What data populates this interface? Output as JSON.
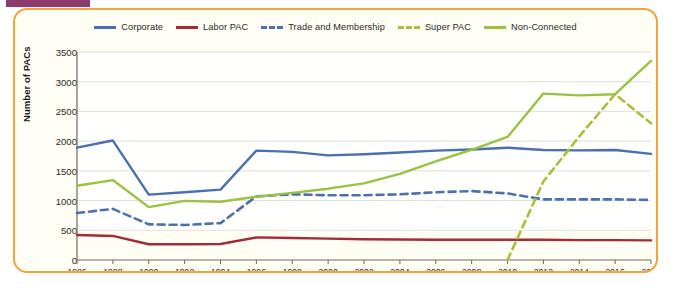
{
  "figure": {
    "frame_color": "#f0a53c",
    "background": "#fffef5",
    "tab_color": "#8d3a6e"
  },
  "chart_data": {
    "type": "line",
    "title": "",
    "xlabel": "",
    "ylabel": "Number of PACs",
    "ylim": [
      0,
      3500
    ],
    "ytick_step": 500,
    "yticks": [
      "0",
      "500",
      "1000",
      "1500",
      "2000",
      "2500",
      "3000",
      "3500"
    ],
    "grid": true,
    "legend_position": "top-center",
    "categories": [
      1986,
      1988,
      1990,
      1992,
      1994,
      1996,
      1998,
      2000,
      2002,
      2004,
      2006,
      2008,
      2010,
      2012,
      2014,
      2016,
      2018
    ],
    "xtick_labels": [
      "1986",
      "1988",
      "1990",
      "1992",
      "1994",
      "1996",
      "1998",
      "2000",
      "2002",
      "2004",
      "2006",
      "2008",
      "2010",
      "2012",
      "2014",
      "2016",
      "2018"
    ],
    "series": [
      {
        "name": "Corporate",
        "color": "#4a70b0",
        "style": "solid",
        "values": [
          1890,
          2010,
          1100,
          1140,
          1185,
          1840,
          1820,
          1760,
          1780,
          1810,
          1840,
          1860,
          1890,
          1850,
          1845,
          1850,
          1785
        ]
      },
      {
        "name": "Labor PAC",
        "color": "#a42a36",
        "style": "solid",
        "values": [
          420,
          405,
          265,
          265,
          270,
          380,
          370,
          360,
          350,
          345,
          340,
          340,
          340,
          340,
          335,
          335,
          330
        ]
      },
      {
        "name": "Trade and Membership",
        "color": "#4a70b0",
        "style": "dashed",
        "values": [
          790,
          860,
          600,
          590,
          620,
          1070,
          1105,
          1090,
          1090,
          1105,
          1140,
          1160,
          1120,
          1020,
          1020,
          1020,
          1010
        ]
      },
      {
        "name": "Super PAC",
        "color": "#a8bf3e",
        "style": "dashed",
        "values": [
          null,
          null,
          null,
          null,
          null,
          null,
          null,
          null,
          null,
          null,
          null,
          null,
          0,
          1320,
          2080,
          2790,
          2300
        ]
      },
      {
        "name": "Non-Connected",
        "color": "#9ac23e",
        "style": "solid",
        "values": [
          1250,
          1345,
          890,
          995,
          980,
          1065,
          1130,
          1200,
          1290,
          1450,
          1660,
          1855,
          2070,
          2800,
          2770,
          2790,
          3350
        ]
      }
    ]
  }
}
